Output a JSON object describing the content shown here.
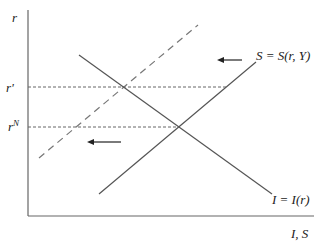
{
  "diagram": {
    "axes": {
      "y_label": "r",
      "x_label": "I, S"
    },
    "levels": [
      {
        "label": "r'",
        "name": "r-prime"
      },
      {
        "label": "r",
        "superscript": "N",
        "name": "r-natural"
      }
    ],
    "curves": [
      {
        "name": "saving-curve",
        "label": "S = S(r, Y)",
        "style": "solid"
      },
      {
        "name": "investment-curve",
        "label": "I = I(r)",
        "style": "solid"
      },
      {
        "name": "shifted-saving-curve",
        "label": "",
        "style": "dashed"
      }
    ],
    "arrows": [
      {
        "name": "shift-arrow-top",
        "direction": "left"
      },
      {
        "name": "shift-arrow-bottom",
        "direction": "left"
      }
    ],
    "colors": {
      "line": "#555555",
      "dashed": "#777777",
      "axis": "#666666",
      "text": "#222222"
    }
  }
}
